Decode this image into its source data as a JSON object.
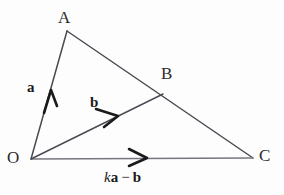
{
  "figure": {
    "width": 284,
    "height": 195,
    "background_color": "#fdfdfd",
    "stroke_color": "#4a4a52",
    "text_color": "#2b2b2b"
  },
  "vertices": {
    "A": {
      "label": "A",
      "x": 67,
      "y": 31
    },
    "B": {
      "label": "B",
      "x": 156,
      "y": 89
    },
    "C": {
      "label": "C",
      "x": 253,
      "y": 158
    },
    "O": {
      "label": "O",
      "x": 31,
      "y": 159
    }
  },
  "segments": [
    {
      "name": "OA",
      "from": "O",
      "to": "A"
    },
    {
      "name": "AC",
      "from": "A",
      "to": "C"
    },
    {
      "name": "OC",
      "from": "O",
      "to": "C"
    },
    {
      "name": "OB",
      "from": "O",
      "to": "B"
    }
  ],
  "vector_labels": {
    "a": "a",
    "b": "b",
    "expression": {
      "k": "k",
      "a": "a",
      "operator": "−",
      "b": "b",
      "full_text": "ka − b"
    }
  }
}
